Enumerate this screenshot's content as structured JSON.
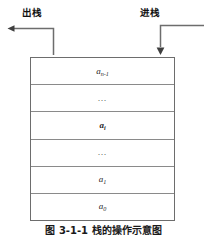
{
  "figure": {
    "title": "栈的操作示意图",
    "caption": "图 3-1-1   栈的操作示意图",
    "labels": {
      "pop": "出栈",
      "push": "进栈"
    },
    "arrows": [
      {
        "name": "pop-arrow",
        "direction": "left",
        "meaning": "出栈"
      },
      {
        "name": "push-arrow",
        "direction": "down",
        "meaning": "进栈"
      }
    ],
    "stack": {
      "cell_count": 6,
      "order": "top-to-bottom",
      "cells": [
        {
          "base": "a",
          "sub": "n-1",
          "bold": false,
          "ellipsis": false
        },
        {
          "base": "…",
          "sub": "",
          "bold": false,
          "ellipsis": true
        },
        {
          "base": "a",
          "sub": "i",
          "bold": true,
          "ellipsis": false
        },
        {
          "base": "…",
          "sub": "",
          "bold": false,
          "ellipsis": true
        },
        {
          "base": "a",
          "sub": "1",
          "bold": false,
          "ellipsis": false
        },
        {
          "base": "a",
          "sub": "0",
          "bold": false,
          "ellipsis": false
        }
      ]
    },
    "colors": {
      "border": "#6d6d6d",
      "divider": "#8a8a8a",
      "text": "#1a1a1a",
      "background": "#ffffff"
    }
  }
}
